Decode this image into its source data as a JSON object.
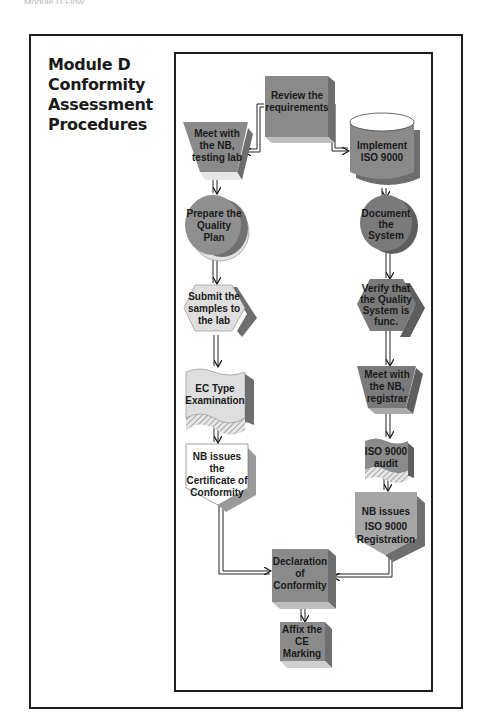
{
  "page_header": "Module D Flow",
  "title": {
    "lines": [
      "Module D",
      "Conformity",
      "Assessment",
      "Procedures"
    ]
  },
  "colors": {
    "dark_fill": "#8a8a8a",
    "medium_fill": "#a3a3a3",
    "light_fill": "#dcdcdc",
    "white_fill": "#ffffff",
    "frame": "#1e1e1e"
  },
  "nodes": {
    "review": {
      "shape": "box-3d",
      "lines": [
        "Review the",
        "requirements"
      ]
    },
    "meet_lab": {
      "shape": "trapezoid",
      "lines": [
        "Meet with",
        "the NB,",
        "testing lab"
      ]
    },
    "implement": {
      "shape": "cylinder",
      "lines": [
        "Implement",
        "ISO 9000"
      ]
    },
    "prepare": {
      "shape": "circle",
      "lines": [
        "Prepare the",
        "Quality",
        "Plan"
      ]
    },
    "document": {
      "shape": "circle",
      "lines": [
        "Document",
        "the",
        "System"
      ]
    },
    "submit": {
      "shape": "hexagon",
      "lines": [
        "Submit the",
        "samples to",
        "the lab"
      ]
    },
    "verify": {
      "shape": "hexagon",
      "lines": [
        "Verify that",
        "the Quality",
        "System is",
        "func."
      ]
    },
    "ec_type": {
      "shape": "wave-doc",
      "lines": [
        "EC Type",
        "Examination"
      ]
    },
    "meet_registrar": {
      "shape": "trapezoid",
      "lines": [
        "Meet with",
        "the NB,",
        "registrar"
      ]
    },
    "nb_cert": {
      "shape": "pentagon-down",
      "lines": [
        "NB issues",
        "the",
        "Certificate of",
        "Conformity"
      ]
    },
    "iso_audit": {
      "shape": "wave-doc",
      "lines": [
        "ISO 9000",
        "audit"
      ]
    },
    "nb_registration": {
      "shape": "pentagon-down",
      "lines": [
        "NB  issues",
        "ISO 9000",
        "Registration"
      ]
    },
    "declaration": {
      "shape": "box-3d",
      "lines": [
        "Declaration",
        "of",
        "Conformity"
      ]
    },
    "affix": {
      "shape": "box-3d",
      "lines": [
        "Affix the",
        "CE",
        "Marking"
      ]
    }
  },
  "edges": [
    [
      "review",
      "meet_lab"
    ],
    [
      "review",
      "implement"
    ],
    [
      "meet_lab",
      "prepare"
    ],
    [
      "prepare",
      "submit"
    ],
    [
      "submit",
      "ec_type"
    ],
    [
      "ec_type",
      "nb_cert"
    ],
    [
      "nb_cert",
      "declaration"
    ],
    [
      "implement",
      "document"
    ],
    [
      "document",
      "verify"
    ],
    [
      "verify",
      "meet_registrar"
    ],
    [
      "meet_registrar",
      "iso_audit"
    ],
    [
      "iso_audit",
      "nb_registration"
    ],
    [
      "nb_registration",
      "declaration"
    ],
    [
      "declaration",
      "affix"
    ]
  ]
}
